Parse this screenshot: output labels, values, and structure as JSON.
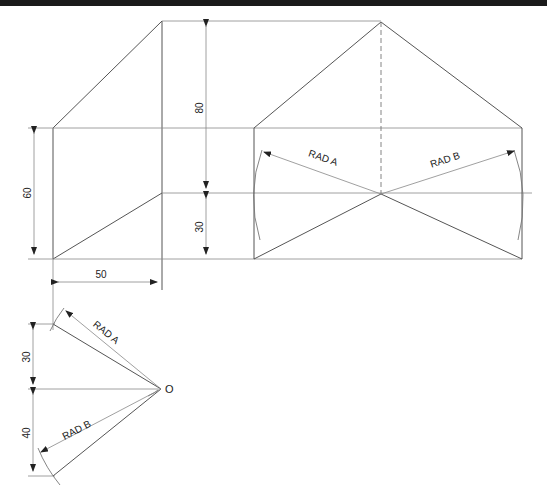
{
  "drawing": {
    "title": "Development of oblique prism with triangular intersection",
    "dimensions": {
      "dim_60": "60",
      "dim_80": "80",
      "dim_30_top": "30",
      "dim_50": "50",
      "dim_30_bottom": "30",
      "dim_40": "40"
    },
    "labels": {
      "rad_a_front": "RAD A",
      "rad_b_front": "RAD B",
      "rad_a_construct": "RAD A",
      "rad_b_construct": "RAD B",
      "origin": "O"
    },
    "colors": {
      "line": "#555555",
      "background": "#ffffff",
      "text": "#222222"
    }
  }
}
